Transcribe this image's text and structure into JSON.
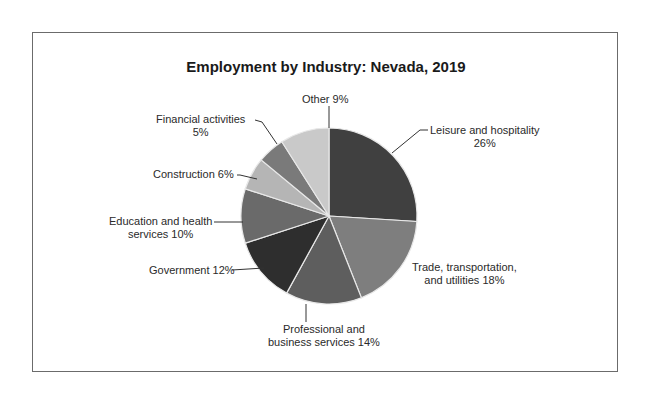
{
  "chart_data": {
    "type": "pie",
    "title": "Employment by Industry: Nevada, 2019",
    "start_angle_deg": 0,
    "direction": "clockwise",
    "slices": [
      {
        "label": "Leisure and hospitality",
        "value": 26,
        "color": "#404040"
      },
      {
        "label": "Trade, transportation, and utilities",
        "value": 18,
        "color": "#7e7e7e"
      },
      {
        "label": "Professional and business services",
        "value": 14,
        "color": "#5e5e5e"
      },
      {
        "label": "Government",
        "value": 12,
        "color": "#2e2e2e"
      },
      {
        "label": "Education and health services",
        "value": 10,
        "color": "#6a6a6a"
      },
      {
        "label": "Construction",
        "value": 6,
        "color": "#b5b5b5"
      },
      {
        "label": "Financial activities",
        "value": 5,
        "color": "#7a7a7a"
      },
      {
        "label": "Other",
        "value": 9,
        "color": "#c9c9c9"
      }
    ]
  },
  "labels": {
    "leisure": [
      "Leisure and hospitality",
      "26%"
    ],
    "trade": [
      "Trade, transportation,",
      "and utilities 18%"
    ],
    "professional": [
      "Professional and",
      "business services 14%"
    ],
    "government": [
      "Government 12%"
    ],
    "education": [
      "Education and health",
      "services 10%"
    ],
    "construction": [
      "Construction  6%"
    ],
    "financial": [
      "Financial activities",
      "5%"
    ],
    "other": [
      "Other 9%"
    ]
  }
}
